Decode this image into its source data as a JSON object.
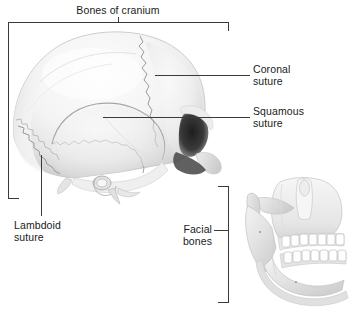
{
  "figure": {
    "type": "anatomical-illustration",
    "background_color": "#ffffff",
    "line_color": "#3a3a3a",
    "text_color": "#1a1a1a",
    "bone_color": "#f2f2f2",
    "bone_shadow_color": "#c9c9c9",
    "tooth_color": "#ffffff",
    "orbit_shadow_color": "#3c3c3c"
  },
  "labels": {
    "bones_of_cranium": "Bones of cranium",
    "coronal_suture_line1": "Coronal",
    "coronal_suture_line2": "suture",
    "squamous_suture_line1": "Squamous",
    "squamous_suture_line2": "suture",
    "lambdoid_suture_line1": "Lambdoid",
    "lambdoid_suture_line2": "suture",
    "facial_bones_line1": "Facial",
    "facial_bones_line2": "bones"
  },
  "bleed_through": {
    "line1": "Bones of",
    "line2": "cranium",
    "line3": "orbit"
  },
  "callouts": [
    {
      "name": "bones-of-cranium",
      "style": "bracket-top",
      "label": "Bones of cranium"
    },
    {
      "name": "coronal-suture",
      "style": "leader-line-right",
      "label": "Coronal suture"
    },
    {
      "name": "squamous-suture",
      "style": "leader-line-right",
      "label": "Squamous suture"
    },
    {
      "name": "lambdoid-suture",
      "style": "leader-line-down",
      "label": "Lambdoid suture"
    },
    {
      "name": "facial-bones",
      "style": "bracket-right",
      "label": "Facial bones"
    }
  ]
}
